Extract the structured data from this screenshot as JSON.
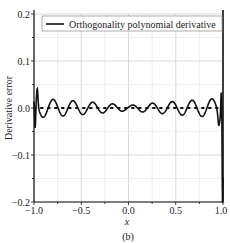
{
  "chart_data": {
    "type": "line",
    "title": "",
    "xlabel": "x",
    "ylabel": "Derivative  error",
    "caption": "(b)",
    "xlim": [
      -1.0,
      1.0
    ],
    "ylim": [
      -0.2,
      0.2
    ],
    "xticks": [
      "-1.0",
      "-0.5",
      "0.0",
      "0.5",
      "1.0"
    ],
    "yticks": [
      "0.2",
      "0.1",
      "0.0",
      "-0.1",
      "-0.2"
    ],
    "grid": true,
    "legend": {
      "position": "upper right",
      "entries": [
        "Orthogonality polynomial derivative"
      ]
    },
    "series": [
      {
        "name": "Orthogonality polynomial derivative",
        "description": "oscillating error around 0, amplitude ~0.005 at center rising to ~0.02 mid-range, edge spikes ~+0.03/-0.06 at x=-1 and ~+0.06/-0.2 at x=1",
        "x": [
          -1.0,
          -0.98,
          -0.96,
          -0.93,
          -0.9,
          -0.85,
          -0.8,
          -0.7,
          -0.6,
          -0.5,
          -0.4,
          -0.3,
          -0.2,
          -0.1,
          0.0,
          0.1,
          0.2,
          0.3,
          0.4,
          0.5,
          0.6,
          0.7,
          0.8,
          0.85,
          0.9,
          0.93,
          0.96,
          0.98,
          1.0
        ],
        "y": [
          0.0,
          -0.06,
          0.032,
          -0.025,
          0.022,
          -0.02,
          0.02,
          -0.018,
          0.018,
          -0.017,
          0.015,
          -0.012,
          0.008,
          -0.005,
          0.004,
          -0.005,
          0.008,
          -0.012,
          0.015,
          -0.017,
          0.018,
          -0.018,
          0.02,
          -0.02,
          0.025,
          -0.035,
          0.06,
          -0.2,
          0.0
        ]
      },
      {
        "name": "zero reference",
        "style": "dotted",
        "x": [
          -1.0,
          1.0
        ],
        "y": [
          0.0,
          0.0
        ]
      }
    ]
  }
}
